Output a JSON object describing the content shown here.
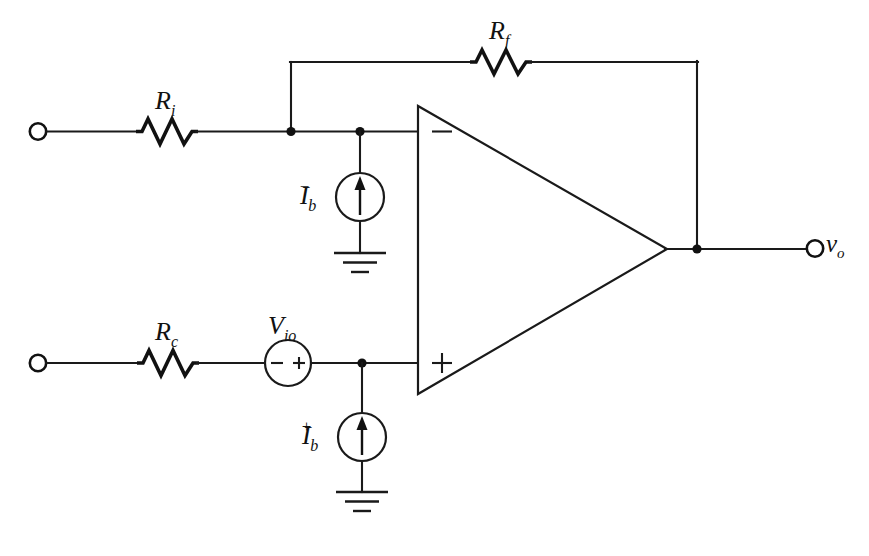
{
  "figure": {
    "kind": "schematic",
    "background_color": "#ffffff",
    "line_color": "#1a1a1a"
  },
  "labels": {
    "r_input": {
      "symbol": "R",
      "subscript": "i"
    },
    "r_feedback": {
      "symbol": "R",
      "subscript": "f"
    },
    "r_compensation": {
      "symbol": "R",
      "subscript": "c"
    },
    "v_offset": {
      "symbol": "V",
      "subscript": "io"
    },
    "i_bias_minus": {
      "symbol": "I",
      "subscript": "b",
      "superscript": "−"
    },
    "i_bias_plus": {
      "symbol": "I",
      "subscript": "b",
      "superscript": "+"
    },
    "v_output": {
      "symbol": "v",
      "subscript": "o"
    }
  },
  "opamp": {
    "inverting_input_sign": "−",
    "noninverting_input_sign": "+"
  },
  "source_polarity": {
    "v_io_left": "−",
    "v_io_right": "+"
  },
  "components": [
    {
      "name": "input-resistor",
      "type": "resistor",
      "label": "R_i"
    },
    {
      "name": "feedback-resistor",
      "type": "resistor",
      "label": "R_f"
    },
    {
      "name": "compensation-resistor",
      "type": "resistor",
      "label": "R_c"
    },
    {
      "name": "offset-voltage-source",
      "type": "voltage-source",
      "label": "V_io"
    },
    {
      "name": "bias-current-source-inverting",
      "type": "current-source",
      "label": "I_b-"
    },
    {
      "name": "bias-current-source-noninverting",
      "type": "current-source",
      "label": "I_b+"
    },
    {
      "name": "operational-amplifier",
      "type": "opamp",
      "label": ""
    }
  ],
  "terminals": [
    {
      "name": "inverting-input-terminal",
      "position": "left-top"
    },
    {
      "name": "noninverting-input-terminal",
      "position": "left-bottom"
    },
    {
      "name": "output-terminal",
      "position": "right",
      "label": "v_o"
    }
  ],
  "grounds": [
    {
      "name": "ground-inverting",
      "bars": 3
    },
    {
      "name": "ground-noninverting",
      "bars": 3
    }
  ]
}
